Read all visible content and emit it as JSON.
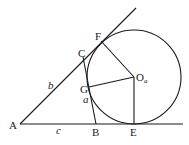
{
  "diagram": {
    "points": {
      "A": "A",
      "B": "B",
      "C": "C",
      "E": "E",
      "F": "F",
      "G": "G",
      "center": "O",
      "center_sub": "a"
    },
    "side_labels": {
      "a": "a",
      "b": "b",
      "c": "c"
    }
  }
}
